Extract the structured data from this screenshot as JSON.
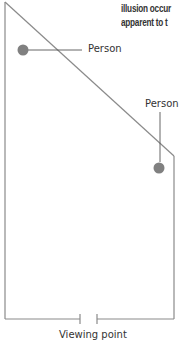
{
  "caption": {
    "line1": "illusion occur",
    "line2": "apparent to t"
  },
  "labels": {
    "person_left": "Person",
    "person_right": "Person",
    "viewing_point": "Viewing point"
  },
  "colors": {
    "line": "#8a8a8a",
    "dot": "#808080",
    "text": "#333333"
  }
}
